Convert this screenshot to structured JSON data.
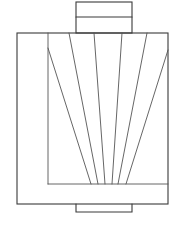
{
  "diagram": {
    "colors": {
      "stroke": "#3a3a3a",
      "stroke_light": "#555555",
      "background": "#ffffff"
    },
    "top_tab": {
      "x": 76,
      "y": 2,
      "w": 56,
      "h": 31,
      "divider_y": 17
    },
    "frame": {
      "x": 17,
      "y": 33,
      "w": 151,
      "h": 171
    },
    "inner_border": {
      "vertical_x": 48,
      "horizontal_y": 184
    },
    "bottom_tab": {
      "x": 76,
      "y": 204,
      "w": 56,
      "h": 8
    },
    "fan_lines": [
      {
        "x1": 48,
        "y1": 48,
        "x2": 91,
        "y2": 184
      },
      {
        "x1": 69,
        "y1": 33,
        "x2": 98,
        "y2": 184
      },
      {
        "x1": 94,
        "y1": 33,
        "x2": 105,
        "y2": 184
      },
      {
        "x1": 122,
        "y1": 33,
        "x2": 112,
        "y2": 184
      },
      {
        "x1": 147,
        "y1": 33,
        "x2": 118,
        "y2": 184
      },
      {
        "x1": 168,
        "y1": 50,
        "x2": 126,
        "y2": 184
      }
    ]
  }
}
